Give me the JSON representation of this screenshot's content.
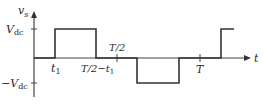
{
  "diagram": {
    "y_axis_label": "v",
    "y_axis_sub": "s",
    "x_axis_label": "t",
    "levels": {
      "positive": {
        "label": "V",
        "sub": "dc"
      },
      "negative": {
        "label": "−V",
        "sub": "dc"
      }
    },
    "ticks": {
      "t1": {
        "label": "t",
        "sub": "1"
      },
      "half_minus_t1": {
        "label": "T/2−t",
        "sub": "1"
      },
      "half_period": {
        "label": "T/2"
      },
      "period": {
        "label": "T"
      }
    },
    "waveform_points": [
      [
        0,
        0
      ],
      [
        "t1",
        0
      ],
      [
        "t1",
        "Vdc"
      ],
      [
        "T/2-t1",
        "Vdc"
      ],
      [
        "T/2-t1",
        0
      ],
      [
        "T/2+t1",
        0
      ],
      [
        "T/2+t1",
        "-Vdc"
      ],
      [
        "T-t1",
        "-Vdc"
      ],
      [
        "T-t1",
        0
      ],
      [
        "T+t1",
        0
      ],
      [
        "T+t1",
        "Vdc"
      ]
    ],
    "colors": {
      "line": "#333333",
      "axis": "#444444",
      "text": "#2a2a2a"
    }
  }
}
